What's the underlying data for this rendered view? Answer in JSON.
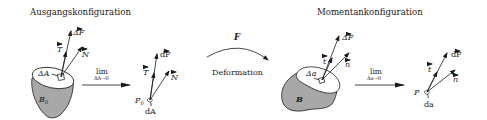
{
  "diagram": {
    "left_title": "Ausgangskonfiguration",
    "right_title": "Momentankonfiguration",
    "body_fill": "#a8a8a8",
    "stroke_color": "#1a1a1a",
    "reference": {
      "body_label": "B",
      "body_sub": "0",
      "area_label": "ΔA",
      "force_label": "ΔF",
      "traction_label": "T",
      "normal_label": "N",
      "limit_text": "lim",
      "limit_sub": "ΔA→0",
      "point_label": "P",
      "point_sub": "0",
      "diff_force_label": "dF",
      "diff_area_label": "dA"
    },
    "deformation": {
      "map_label": "F",
      "caption": "Deformation"
    },
    "current": {
      "body_label": "B",
      "area_label": "Δa",
      "force_label": "ΔF",
      "traction_label": "t",
      "normal_label": "n",
      "limit_text": "lim",
      "limit_sub": "Δa→0",
      "point_label": "P",
      "diff_force_label": "dF",
      "diff_area_label": "da"
    }
  }
}
